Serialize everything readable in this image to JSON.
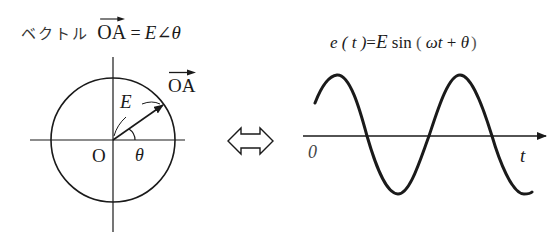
{
  "phasor": {
    "title_prefix": "ベクトル",
    "title_vector": "OA",
    "title_equals": "=",
    "title_magnitude": "E",
    "title_angle_sym": "∠",
    "title_angle": "θ",
    "vector_label": "OA",
    "magnitude_label": "E",
    "origin_label": "O",
    "angle_label": "θ"
  },
  "equivalence_icon": "double-arrow-icon",
  "waveform": {
    "equation": {
      "lhs": "e",
      "lhs_arg": "( t )",
      "equals": "=",
      "amp": "E",
      "func": "sin",
      "open": "(",
      "omega_t": "ωt",
      "plus": "+",
      "theta": "θ",
      "close": ")"
    },
    "origin_label": "0",
    "axis_label": "t"
  },
  "colors": {
    "ink": "#1a1a1a",
    "background": "#ffffff"
  }
}
